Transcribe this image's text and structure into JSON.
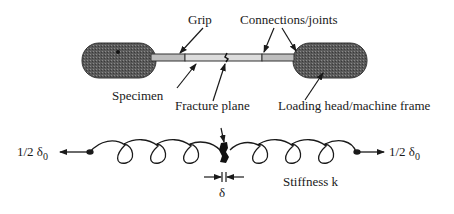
{
  "diagram": {
    "type": "mechanical-schematic",
    "labels": {
      "grip": "Grip",
      "connections": "Connections/joints",
      "specimen": "Specimen",
      "fracture_plane": "Fracture plane",
      "loading_head": "Loading head/machine frame",
      "stiffness": "Stiffness k",
      "delta": "δ",
      "displacement_left": "1/2 δ",
      "displacement_left_sub": "0",
      "displacement_right": "1/2 δ",
      "displacement_right_sub": "0"
    },
    "colors": {
      "head_fill": "#555555",
      "grip_fill": "#bdbdbd",
      "specimen_fill": "#dcdcdc",
      "line": "#1a1a1a"
    },
    "parts": [
      "loading head (left)",
      "grip (left)",
      "specimen",
      "fracture plane",
      "grip (right)",
      "loading head (right)",
      "spring with stiffness k"
    ]
  }
}
